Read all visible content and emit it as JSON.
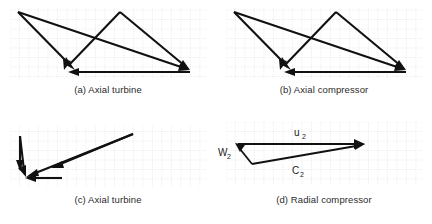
{
  "figure": {
    "background_color": "#ffffff",
    "vector_color": "#111111",
    "grid_color": "#c9c9c9"
  },
  "grid": {
    "spacing_px": 9.5,
    "style": "dotted",
    "visible": true
  },
  "panels": [
    {
      "id": "a",
      "caption": "(a) Axial turbine",
      "grid": {
        "x": 10,
        "y": 8,
        "width": 196,
        "height": 70
      },
      "vectors": [
        {
          "name": "v1",
          "x1": 18,
          "y1": 12,
          "x2": 75,
          "y2": 70,
          "label": ""
        },
        {
          "name": "v2",
          "x1": 18,
          "y1": 12,
          "x2": 190,
          "y2": 70,
          "label": ""
        },
        {
          "name": "v3",
          "x1": 120,
          "y1": 12,
          "x2": 64,
          "y2": 70,
          "label": ""
        },
        {
          "name": "v4",
          "x1": 120,
          "y1": 12,
          "x2": 190,
          "y2": 70,
          "label": ""
        },
        {
          "name": "v5",
          "x1": 190,
          "y1": 72,
          "x2": 70,
          "y2": 72,
          "label": ""
        }
      ]
    },
    {
      "id": "b",
      "caption": "(b) Axial compressor",
      "grid": {
        "x": 10,
        "y": 8,
        "width": 196,
        "height": 70
      },
      "vectors": [
        {
          "name": "v1",
          "x1": 18,
          "y1": 12,
          "x2": 75,
          "y2": 70,
          "label": ""
        },
        {
          "name": "v2",
          "x1": 18,
          "y1": 12,
          "x2": 190,
          "y2": 70,
          "label": ""
        },
        {
          "name": "v3",
          "x1": 120,
          "y1": 12,
          "x2": 64,
          "y2": 70,
          "label": ""
        },
        {
          "name": "v4",
          "x1": 120,
          "y1": 12,
          "x2": 190,
          "y2": 70,
          "label": ""
        },
        {
          "name": "v5",
          "x1": 190,
          "y1": 72,
          "x2": 70,
          "y2": 72,
          "label": ""
        }
      ]
    },
    {
      "id": "c",
      "caption": "(c) Axial turbine",
      "grid": {
        "x": 10,
        "y": 14,
        "width": 196,
        "height": 62
      },
      "vectors": [
        {
          "name": "v1",
          "x1": 20,
          "y1": 24,
          "x2": 20,
          "y2": 58,
          "label": ""
        },
        {
          "name": "v2",
          "x1": 20,
          "y1": 24,
          "x2": 26,
          "y2": 64,
          "label": ""
        },
        {
          "name": "v3",
          "x1": 133,
          "y1": 22,
          "x2": 26,
          "y2": 64,
          "label": ""
        },
        {
          "name": "v4",
          "x1": 133,
          "y1": 22,
          "x2": 52,
          "y2": 56,
          "label": ""
        },
        {
          "name": "v5",
          "x1": 62,
          "y1": 66,
          "x2": 26,
          "y2": 66,
          "label": ""
        }
      ]
    },
    {
      "id": "d",
      "caption": "(d) Radial compressor",
      "grid": {
        "x": 10,
        "y": 10,
        "width": 196,
        "height": 64
      },
      "vectors": [
        {
          "name": "u2",
          "x1": 22,
          "y1": 32,
          "x2": 148,
          "y2": 32,
          "label": "u",
          "subscript": "2",
          "label_x": 82,
          "label_y": 25
        },
        {
          "name": "w2",
          "x1": 36,
          "y1": 52,
          "x2": 20,
          "y2": 32,
          "label": "W",
          "subscript": "2",
          "label_x": 2,
          "label_y": 45
        },
        {
          "name": "c2",
          "x1": 36,
          "y1": 52,
          "x2": 148,
          "y2": 32,
          "label": "C",
          "subscript": "2",
          "label_x": 80,
          "label_y": 62
        }
      ]
    }
  ]
}
